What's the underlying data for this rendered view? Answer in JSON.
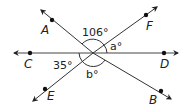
{
  "diagram": {
    "type": "intersecting-lines",
    "center": {
      "x": 93,
      "y": 53
    },
    "stroke_color": "#333333",
    "points": {
      "A": {
        "label": "A",
        "dot": {
          "x": 52,
          "y": 20
        },
        "text": {
          "x": 44,
          "y": 34
        }
      },
      "B": {
        "label": "B",
        "dot": {
          "x": 161,
          "y": 91
        },
        "text": {
          "x": 148,
          "y": 105
        }
      },
      "C": {
        "label": "C",
        "dot": {
          "x": 30,
          "y": 53
        },
        "text": {
          "x": 25,
          "y": 68
        }
      },
      "D": {
        "label": "D",
        "dot": {
          "x": 164,
          "y": 53
        },
        "text": {
          "x": 159,
          "y": 68
        }
      },
      "E": {
        "label": "E",
        "dot": {
          "x": 45,
          "y": 89
        },
        "text": {
          "x": 47,
          "y": 101
        }
      },
      "F": {
        "label": "F",
        "dot": {
          "x": 146,
          "y": 15
        },
        "text": {
          "x": 145,
          "y": 31
        }
      }
    },
    "angles": {
      "top": {
        "label": "106°",
        "x": 83,
        "y": 35
      },
      "a": {
        "label": "a°",
        "x": 110,
        "y": 49
      },
      "left": {
        "label": "35°",
        "x": 52,
        "y": 69
      },
      "b": {
        "label": "b°",
        "x": 86,
        "y": 79
      }
    }
  }
}
